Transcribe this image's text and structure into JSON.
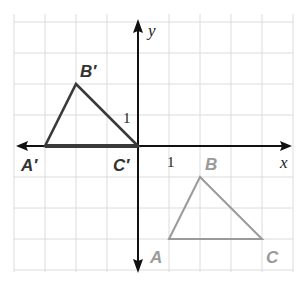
{
  "diagram": {
    "type": "coordinate-plane-transformation",
    "axes": {
      "x_label": "x",
      "y_label": "y",
      "unit_label_x": "1",
      "unit_label_y": "1"
    },
    "grid": {
      "x_range": [
        -4,
        5
      ],
      "y_range": [
        -4,
        4
      ],
      "origin_px": [
        138,
        146
      ],
      "unit_px": 31
    },
    "colors": {
      "grid": "#dcdcdc",
      "axis": "#111111",
      "image": "#3a3a3a",
      "preimage": "#9a9a9a"
    },
    "image_triangle": {
      "points": [
        {
          "label": "A′",
          "x": -3,
          "y": 0
        },
        {
          "label": "B′",
          "x": -2,
          "y": 2
        },
        {
          "label": "C′",
          "x": 0,
          "y": 0
        }
      ]
    },
    "preimage_triangle": {
      "points": [
        {
          "label": "A",
          "x": 1,
          "y": -3
        },
        {
          "label": "B",
          "x": 2,
          "y": -1
        },
        {
          "label": "C",
          "x": 4,
          "y": -3
        }
      ]
    }
  }
}
